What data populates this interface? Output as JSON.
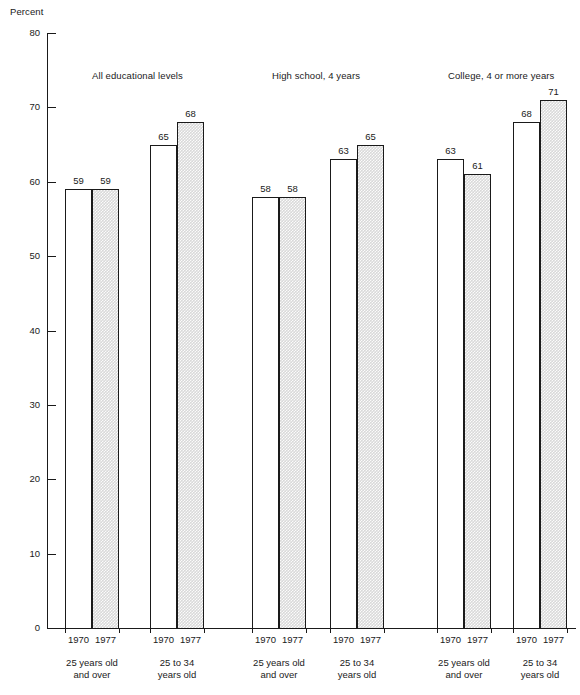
{
  "chart_data": {
    "type": "bar",
    "title": "",
    "ylabel": "Percent",
    "xlabel": "",
    "ylim": [
      0,
      80
    ],
    "yticks": [
      0,
      10,
      20,
      30,
      40,
      50,
      60,
      70,
      80
    ],
    "grid": false,
    "legend": "none",
    "categories": [
      "All educational levels / 25 years old and over",
      "All educational levels / 25 to 34 years old",
      "High school, 4 years / 25 years old and over",
      "High school, 4 years / 25 to 34 years old",
      "College, 4 or more years / 25 years old and over",
      "College, 4 or more years / 25 to 34 years old"
    ],
    "series": [
      {
        "name": "1970",
        "values": [
          59,
          65,
          58,
          63,
          63,
          68
        ]
      },
      {
        "name": "1977",
        "values": [
          59,
          68,
          58,
          65,
          61,
          71
        ]
      }
    ]
  },
  "axis": {
    "y_title": "Percent",
    "ticks": [
      {
        "value": 80,
        "label": "80"
      },
      {
        "value": 70,
        "label": "70"
      },
      {
        "value": 60,
        "label": "60"
      },
      {
        "value": 50,
        "label": "50"
      },
      {
        "value": 40,
        "label": "40"
      },
      {
        "value": 30,
        "label": "30"
      },
      {
        "value": 20,
        "label": "20"
      },
      {
        "value": 10,
        "label": "10"
      },
      {
        "value": 0,
        "label": "0"
      }
    ]
  },
  "groups": [
    {
      "title": "All educational levels",
      "pairs": [
        {
          "category_line1": "25 years old",
          "category_line2": "and over",
          "bars": [
            {
              "year": "1970",
              "value": 59,
              "label": "59",
              "style": "plain"
            },
            {
              "year": "1977",
              "value": 59,
              "label": "59",
              "style": "hatched"
            }
          ]
        },
        {
          "category_line1": "25 to 34",
          "category_line2": "years old",
          "bars": [
            {
              "year": "1970",
              "value": 65,
              "label": "65",
              "style": "plain"
            },
            {
              "year": "1977",
              "value": 68,
              "label": "68",
              "style": "hatched"
            }
          ]
        }
      ]
    },
    {
      "title": "High school, 4 years",
      "pairs": [
        {
          "category_line1": "25 years old",
          "category_line2": "and over",
          "bars": [
            {
              "year": "1970",
              "value": 58,
              "label": "58",
              "style": "plain"
            },
            {
              "year": "1977",
              "value": 58,
              "label": "58",
              "style": "hatched"
            }
          ]
        },
        {
          "category_line1": "25 to 34",
          "category_line2": "years old",
          "bars": [
            {
              "year": "1970",
              "value": 63,
              "label": "63",
              "style": "plain"
            },
            {
              "year": "1977",
              "value": 65,
              "label": "65",
              "style": "hatched"
            }
          ]
        }
      ]
    },
    {
      "title": "College, 4 or more years",
      "pairs": [
        {
          "category_line1": "25 years old",
          "category_line2": "and over",
          "bars": [
            {
              "year": "1970",
              "value": 63,
              "label": "63",
              "style": "plain"
            },
            {
              "year": "1977",
              "value": 61,
              "label": "61",
              "style": "hatched"
            }
          ]
        },
        {
          "category_line1": "25 to 34",
          "category_line2": "years old",
          "bars": [
            {
              "year": "1970",
              "value": 68,
              "label": "68",
              "style": "plain"
            },
            {
              "year": "1977",
              "value": 71,
              "label": "71",
              "style": "hatched"
            }
          ]
        }
      ]
    }
  ],
  "colors": {
    "ink": "#1a1a1a",
    "bar_plain_fill": "#ffffff",
    "bar_hatched_fill": "#d9d9d9",
    "background": "#ffffff"
  },
  "layout": {
    "group_title_x": [
      92,
      272,
      448
    ],
    "group_title_y": 70,
    "pair_left_x": [
      65,
      150,
      252,
      330,
      437,
      513
    ],
    "bar_width": 27,
    "baseline_y": 628,
    "top_value_y": 33,
    "px_per_unit": 7.4375
  }
}
